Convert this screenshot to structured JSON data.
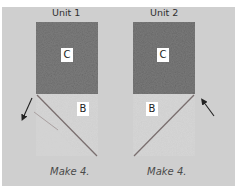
{
  "units": [
    {
      "title": "Unit 1",
      "dark_square_label": "C",
      "light_square_label": "B",
      "caption": "Make 4.",
      "diagonal": "top-left to bottom-right",
      "arrow_direction": "down-left"
    },
    {
      "title": "Unit 2",
      "dark_square_label": "C",
      "light_square_label": "B",
      "caption": "Make 4.",
      "diagonal": "top-right to bottom-left",
      "arrow_direction": "up-left"
    }
  ],
  "colors": {
    "panel_bg": "#cfcfcf",
    "dark_fabric": "#7d7d7d",
    "light_fabric": "#d8d8d8",
    "seam_line": "#7a6f6f",
    "arrow": "#222222"
  }
}
